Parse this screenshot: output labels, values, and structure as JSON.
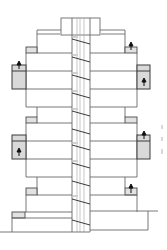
{
  "diagram": {
    "type": "architectural-elevation",
    "colors": {
      "line": "#6a6a6a",
      "line_dark": "#3a3a3a",
      "fill_box": "#d9d9d9",
      "background": "#ffffff"
    },
    "floors_count": 10,
    "side_annotation_text": ""
  }
}
